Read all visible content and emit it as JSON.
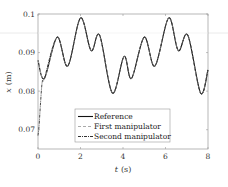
{
  "chart_data": {
    "type": "line",
    "title": "",
    "xlabel": "t (s)",
    "ylabel": "x (m)",
    "xlim": [
      0,
      8
    ],
    "ylim": [
      0.065,
      0.1
    ],
    "xticks": [
      0,
      2,
      4,
      6,
      8
    ],
    "xtick_labels": [
      "0",
      "2",
      "4",
      "6",
      "8"
    ],
    "yticks": [
      0.07,
      0.08,
      0.09,
      0.1
    ],
    "ytick_labels": [
      "0.07",
      "0.08",
      "0.09",
      "0.1"
    ],
    "grid": false,
    "legend_position": "lower center",
    "series": [
      {
        "name": "Reference",
        "style": "solid",
        "color": "#111111",
        "x": [
          0,
          0.3,
          0.9,
          1.4,
          2.0,
          2.5,
          2.9,
          3.5,
          4.05,
          4.4,
          5.0,
          5.5,
          6.15,
          6.6,
          7.05,
          7.65,
          8.0
        ],
        "y": [
          0.088,
          0.0833,
          0.094,
          0.0865,
          0.099,
          0.0905,
          0.0945,
          0.0795,
          0.089,
          0.0833,
          0.094,
          0.0865,
          0.099,
          0.0905,
          0.0945,
          0.0795,
          0.0855
        ]
      },
      {
        "name": "First manipulator",
        "style": "dashed",
        "color": "#aaaaaa",
        "x": [
          0,
          0.3,
          0.9,
          1.4,
          2.0,
          2.5,
          2.9,
          3.5,
          4.05,
          4.4,
          5.0,
          5.5,
          6.15,
          6.6,
          7.05,
          7.65,
          8.0
        ],
        "y": [
          0.088,
          0.0833,
          0.094,
          0.0865,
          0.099,
          0.0905,
          0.0945,
          0.0795,
          0.089,
          0.0833,
          0.094,
          0.0865,
          0.099,
          0.0905,
          0.0945,
          0.0795,
          0.0855
        ]
      },
      {
        "name": "Second manipulator",
        "style": "dashdot",
        "color": "#333333",
        "x": [
          0,
          0.05,
          0.12,
          0.2,
          0.3,
          0.9,
          1.4,
          2.0,
          2.5,
          2.9,
          3.5,
          4.05,
          4.4,
          5.0,
          5.5,
          6.15,
          6.6,
          7.05,
          7.65,
          8.0
        ],
        "y": [
          0.0685,
          0.071,
          0.077,
          0.0825,
          0.0833,
          0.094,
          0.0865,
          0.099,
          0.0905,
          0.0945,
          0.0795,
          0.089,
          0.0833,
          0.094,
          0.0865,
          0.099,
          0.0905,
          0.0945,
          0.0795,
          0.0855
        ]
      }
    ]
  },
  "axes": {
    "xlabel_var": "t",
    "xlabel_unit": "(s)",
    "ylabel_var": "x",
    "ylabel_unit": "(m)"
  },
  "legend": {
    "items": [
      "Reference",
      "First manipulator",
      "Second manipulator"
    ]
  }
}
